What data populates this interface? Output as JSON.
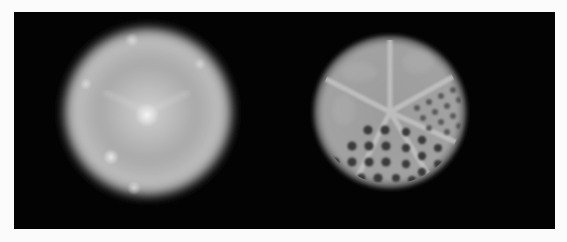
{
  "figure": {
    "background_color": "#030303",
    "page_color": "#fbfbfb",
    "panels": [
      {
        "id": "left",
        "label": "Blurred uniform disc reconstruction",
        "center": [
          134,
          100
        ],
        "radius": 86
      },
      {
        "id": "right",
        "label": "Hot/cold rod sector phantom reconstruction",
        "center": [
          376,
          100
        ],
        "radius": 77
      }
    ]
  }
}
